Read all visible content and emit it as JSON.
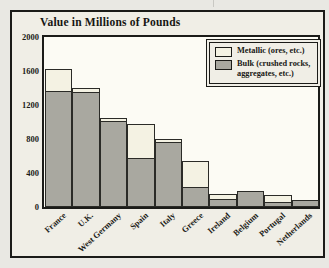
{
  "title": "Value in Millions of Pounds",
  "legend": {
    "items": [
      {
        "label": "Metallic (ores, etc.)",
        "color": "#f4f2e3"
      },
      {
        "label": "Bulk (crushed rocks, aggregates, etc.)",
        "color": "#a9a8a0"
      }
    ]
  },
  "chart_data": {
    "type": "bar",
    "stacked": true,
    "title": "Value in Millions of Pounds",
    "categories": [
      "France",
      "U.K.",
      "West Germany",
      "Spain",
      "Italy",
      "Greece",
      "Ireland",
      "Belgium",
      "Portugal",
      "Netherlands"
    ],
    "series": [
      {
        "name": "Bulk (crushed rocks, aggregates, etc.)",
        "color": "#a9a8a0",
        "values": [
          1370,
          1350,
          1010,
          580,
          760,
          240,
          90,
          190,
          60,
          80
        ]
      },
      {
        "name": "Metallic (ores, etc.)",
        "color": "#f4f2e3",
        "values": [
          270,
          60,
          50,
          410,
          50,
          310,
          80,
          0,
          95,
          0
        ]
      }
    ],
    "totals": [
      1640,
      1410,
      1060,
      990,
      810,
      550,
      170,
      190,
      155,
      80
    ],
    "ylabel": "Value in Millions of Pounds",
    "xlabel": "",
    "ylim": [
      0,
      2000
    ],
    "yticks": [
      0,
      400,
      800,
      1200,
      1600,
      2000
    ],
    "grid": false,
    "legend_position": "top-right"
  }
}
